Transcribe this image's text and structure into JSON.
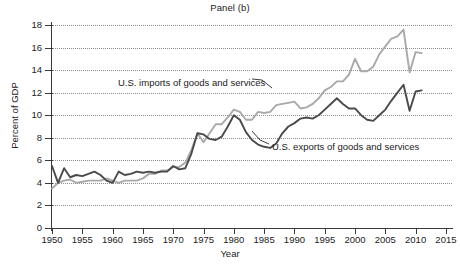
{
  "chart_data": {
    "type": "line",
    "title": "Panel (b)",
    "xlabel": "Year",
    "ylabel": "Percent of GDP",
    "grid": true,
    "grid_style": "dotted-horizontal",
    "legend_position": "inline-annotations",
    "xlim": [
      1950,
      2016
    ],
    "ylim": [
      0,
      18
    ],
    "xticks": [
      1950,
      1955,
      1960,
      1965,
      1970,
      1975,
      1980,
      1985,
      1990,
      1995,
      2000,
      2005,
      2010,
      2015
    ],
    "yticks": [
      0,
      2,
      4,
      6,
      8,
      10,
      12,
      14,
      16,
      18
    ],
    "xtick_labels": [
      "1950",
      "1955",
      "1960",
      "1965",
      "1970",
      "1975",
      "1980",
      "1985",
      "1990",
      "1995",
      "2000",
      "2005",
      "2010",
      "2015"
    ],
    "ytick_labels": [
      "0",
      "2",
      "4",
      "6",
      "8",
      "10",
      "12",
      "14",
      "16",
      "18"
    ],
    "x": [
      1950,
      1951,
      1952,
      1953,
      1954,
      1955,
      1956,
      1957,
      1958,
      1959,
      1960,
      1961,
      1962,
      1963,
      1964,
      1965,
      1966,
      1967,
      1968,
      1969,
      1970,
      1971,
      1972,
      1973,
      1974,
      1975,
      1976,
      1977,
      1978,
      1979,
      1980,
      1981,
      1982,
      1983,
      1984,
      1985,
      1986,
      1987,
      1988,
      1989,
      1990,
      1991,
      1992,
      1993,
      1994,
      1995,
      1996,
      1997,
      1998,
      1999,
      2000,
      2001,
      2002,
      2003,
      2004,
      2005,
      2006,
      2007,
      2008,
      2009,
      2010,
      2011
    ],
    "series": [
      {
        "name": "U.S. imports of goods and services",
        "color": "#a9a9a9",
        "annotation": "U.S. imports of goods and services",
        "values": [
          3.5,
          4.0,
          4.2,
          4.3,
          4.0,
          4.1,
          4.2,
          4.2,
          4.2,
          4.4,
          4.2,
          4.0,
          4.2,
          4.2,
          4.2,
          4.4,
          4.8,
          4.8,
          5.1,
          5.1,
          5.4,
          5.4,
          5.8,
          6.9,
          8.4,
          7.6,
          8.4,
          9.2,
          9.2,
          9.8,
          10.5,
          10.3,
          9.6,
          9.6,
          10.3,
          10.2,
          10.3,
          10.9,
          11.0,
          11.1,
          11.2,
          10.6,
          10.7,
          11.0,
          11.5,
          12.2,
          12.5,
          13.0,
          13.0,
          13.6,
          15.0,
          13.9,
          13.9,
          14.3,
          15.4,
          16.1,
          16.8,
          17.0,
          17.6,
          13.8,
          15.6,
          15.5
        ]
      },
      {
        "name": "U.S. exports of goods and services",
        "color": "#4a4a4a",
        "annotation": "U.S. exports of goods and services",
        "values": [
          5.5,
          4.0,
          5.3,
          4.5,
          4.7,
          4.6,
          4.8,
          5.0,
          4.7,
          4.2,
          4.0,
          5.0,
          4.7,
          4.8,
          5.0,
          4.9,
          5.0,
          4.9,
          5.0,
          5.0,
          5.5,
          5.2,
          5.3,
          6.6,
          8.4,
          8.3,
          7.9,
          7.8,
          8.1,
          9.0,
          10.0,
          9.6,
          8.5,
          7.8,
          7.4,
          7.2,
          7.1,
          7.5,
          8.4,
          9.0,
          9.3,
          9.7,
          9.8,
          9.7,
          10.0,
          10.5,
          11.0,
          11.5,
          11.0,
          10.6,
          10.6,
          10.0,
          9.6,
          9.5,
          10.0,
          10.5,
          11.3,
          12.0,
          12.7,
          10.4,
          12.1,
          12.2
        ]
      }
    ]
  },
  "annotations": {
    "imports_label": "U.S. imports of goods and services",
    "exports_label": "U.S. exports of goods and services"
  }
}
